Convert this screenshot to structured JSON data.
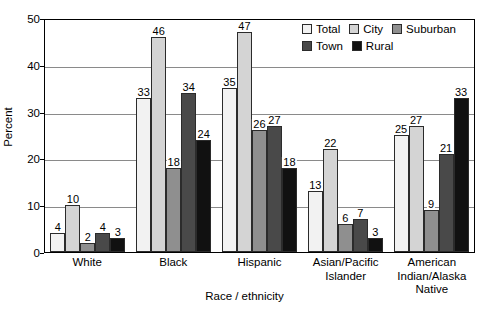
{
  "chart_data": {
    "type": "bar",
    "title": "",
    "xlabel": "Race / ethnicity",
    "ylabel": "Percent",
    "ylim": [
      0,
      50
    ],
    "yticks": [
      0,
      10,
      20,
      30,
      40,
      50
    ],
    "grid": true,
    "legend_position": "top-right",
    "categories": [
      "White",
      "Black",
      "Hispanic",
      "Asian/Pacific Islander",
      "American Indian/Alaska Native"
    ],
    "category_lines": [
      [
        "White"
      ],
      [
        "Black"
      ],
      [
        "Hispanic"
      ],
      [
        "Asian/Pacific",
        "Islander"
      ],
      [
        "American",
        "Indian/Alaska",
        "Native"
      ]
    ],
    "series": [
      {
        "name": "Total",
        "color": "#f2f2f2",
        "values": [
          4,
          33,
          35,
          13,
          25
        ]
      },
      {
        "name": "City",
        "color": "#d4d4d4",
        "values": [
          10,
          46,
          47,
          22,
          27
        ]
      },
      {
        "name": "Suburban",
        "color": "#8f8f8f",
        "values": [
          2,
          18,
          26,
          6,
          9
        ]
      },
      {
        "name": "Town",
        "color": "#494949",
        "values": [
          4,
          34,
          27,
          7,
          21
        ]
      },
      {
        "name": "Rural",
        "color": "#111111",
        "values": [
          3,
          24,
          18,
          3,
          33
        ]
      }
    ]
  }
}
